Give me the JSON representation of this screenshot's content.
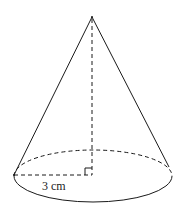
{
  "diagram": {
    "type": "cone",
    "shape": "right circular cone",
    "radius_label": "3 cm",
    "elements": {
      "apex": {
        "x": 92,
        "y": 17
      },
      "base_center": {
        "x": 93,
        "y": 176
      },
      "base_rx": 79,
      "base_ry": 26,
      "height_line": "dashed",
      "radius_line": "dashed",
      "back_base_edge": "dashed",
      "front_base_edge": "solid",
      "right_angle_marker": true
    },
    "colors": {
      "stroke": "#1a1a1a",
      "label": "#222222",
      "background": "#ffffff"
    }
  }
}
